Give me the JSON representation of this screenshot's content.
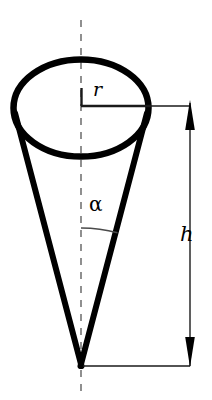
{
  "figure": {
    "type": "geometry-diagram",
    "width": 212,
    "height": 400,
    "background_color": "#ffffff",
    "stroke_color": "#000000"
  },
  "labels": {
    "radius": "r",
    "height": "h",
    "half_angle": "α"
  },
  "geometry": {
    "ellipse": {
      "name": "cone-base-ellipse",
      "center_x": 81,
      "center_y": 108,
      "radius_x": 68,
      "radius_y": 49,
      "stroke_width": 6.5
    },
    "apex": {
      "x": 81,
      "y": 366
    },
    "slant_left": {
      "x1": 14,
      "y1": 112,
      "x2": 81,
      "y2": 366,
      "stroke_width": 6
    },
    "slant_right": {
      "x1": 148,
      "y1": 112,
      "x2": 81,
      "y2": 366,
      "stroke_width": 6
    },
    "axis_dashed": {
      "x": 81,
      "y_top": 20,
      "y_bottom": 396,
      "stroke_width": 1.3,
      "dash": "7 7"
    },
    "radius_line": {
      "x1": 81,
      "y1": 106,
      "x2": 150,
      "y2": 106,
      "stroke_width": 2.6,
      "tick_top_y": 88
    },
    "angle_arc": {
      "vertex_x": 81,
      "vertex_y": 366,
      "radius": 138,
      "stroke_width": 1.3
    },
    "dimension_h": {
      "x": 190,
      "y_top": 101,
      "y_bottom": 366,
      "stroke_width": 1.3,
      "arrow_half_width": 5,
      "arrow_length": 27
    },
    "extension_top": {
      "x1": 148,
      "y1": 106,
      "x2": 190,
      "y2": 106,
      "stroke_width": 1.3
    },
    "extension_bottom": {
      "x1": 83,
      "y1": 366,
      "x2": 190,
      "y2": 366,
      "stroke_width": 1.3
    }
  },
  "colors": {
    "ink": "#000000",
    "thin_ink": "#2b2b2b",
    "paper": "#ffffff"
  }
}
